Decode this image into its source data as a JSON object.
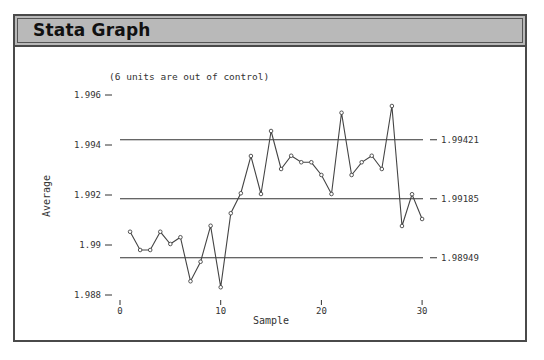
{
  "window": {
    "title": "Stata Graph"
  },
  "chart_data": {
    "type": "line",
    "title": "",
    "subtitle": "(6 units are out of control)",
    "xlabel": "Sample",
    "ylabel": "Average",
    "xlim": [
      0,
      30
    ],
    "ylim": [
      1.988,
      1.996
    ],
    "x_ticks": [
      0,
      10,
      20,
      30
    ],
    "x_tick_labels": [
      "0",
      "10",
      "20",
      "30"
    ],
    "y_ticks": [
      1.996,
      1.994,
      1.992,
      1.99,
      1.988
    ],
    "y_tick_labels": [
      "1.996",
      "1.994",
      "1.992",
      "1.99",
      "1.988"
    ],
    "grid": false,
    "legend": null,
    "control_limits": [
      {
        "name": "UCL",
        "value": 1.99421,
        "label": "1.99421"
      },
      {
        "name": "Center line",
        "value": 1.99185,
        "label": "1.99185"
      },
      {
        "name": "LCL",
        "value": 1.98949,
        "label": "1.98949"
      }
    ],
    "series": [
      {
        "name": "Sample average",
        "marker": "circle",
        "x": [
          1,
          2,
          3,
          4,
          5,
          6,
          7,
          8,
          9,
          10,
          11,
          12,
          13,
          14,
          15,
          16,
          17,
          18,
          19,
          20,
          21,
          22,
          23,
          24,
          25,
          26,
          27,
          28,
          29,
          30
        ],
        "values": [
          1.99053,
          1.9898,
          1.9898,
          1.99053,
          1.99004,
          1.99031,
          1.98855,
          1.98933,
          1.99077,
          1.98831,
          1.99127,
          1.99207,
          1.99356,
          1.99204,
          1.99456,
          1.99304,
          1.99357,
          1.99331,
          1.99331,
          1.9928,
          1.99204,
          1.99529,
          1.9928,
          1.99331,
          1.99357,
          1.99304,
          1.99556,
          1.99076,
          1.99203,
          1.99104
        ]
      }
    ]
  }
}
